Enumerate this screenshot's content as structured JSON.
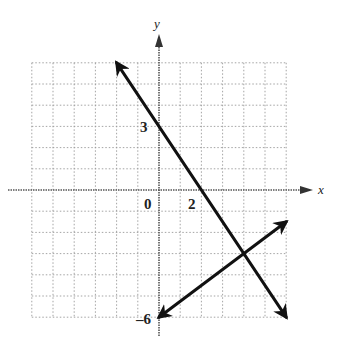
{
  "chart_data": {
    "type": "line",
    "title": "",
    "xlabel": "x",
    "ylabel": "y",
    "xlim": [
      -6,
      6
    ],
    "ylim": [
      -6,
      6
    ],
    "grid": true,
    "tick_labels": [
      {
        "axis": "origin",
        "value": 0,
        "text": "0"
      },
      {
        "axis": "x",
        "value": 2,
        "text": "2"
      },
      {
        "axis": "y",
        "value": 3,
        "text": "3"
      },
      {
        "axis": "y",
        "value": -6,
        "text": "-6"
      }
    ],
    "series": [
      {
        "name": "line-1",
        "equation": "y = -1.5x + 3",
        "points": [
          [
            -2,
            6
          ],
          [
            0,
            3
          ],
          [
            2,
            0
          ],
          [
            4,
            -3
          ],
          [
            6,
            -6
          ]
        ],
        "arrows": "both"
      },
      {
        "name": "line-2",
        "equation": "y = 0.75x - 6",
        "points": [
          [
            0,
            -6
          ],
          [
            4,
            -3
          ],
          [
            6,
            -1.5
          ]
        ],
        "arrows": "both"
      }
    ],
    "intersection": [
      4,
      -3
    ]
  },
  "labels": {
    "x_axis": "x",
    "y_axis": "y",
    "origin": "0",
    "x_tick_2": "2",
    "y_tick_3": "3",
    "y_tick_neg6": "–6"
  }
}
